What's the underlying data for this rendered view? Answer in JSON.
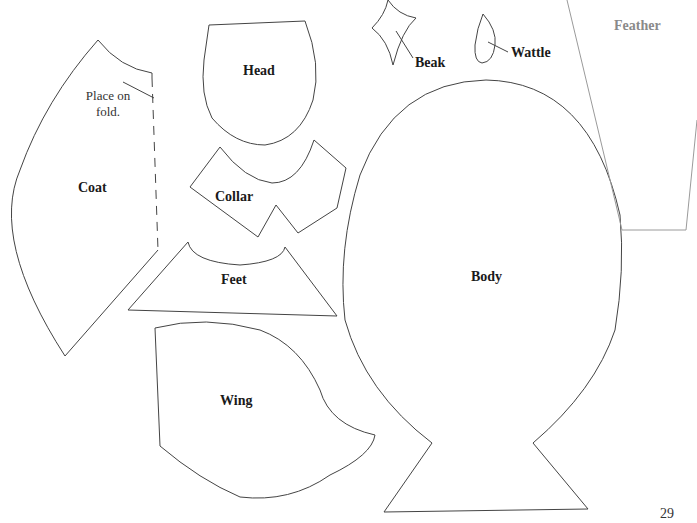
{
  "pieces": {
    "coat": {
      "label": "Coat",
      "note": "Place on fold."
    },
    "head": {
      "label": "Head"
    },
    "collar": {
      "label": "Collar"
    },
    "feet": {
      "label": "Feet"
    },
    "wing": {
      "label": "Wing"
    },
    "beak": {
      "label": "Beak"
    },
    "wattle": {
      "label": "Wattle"
    },
    "body": {
      "label": "Body"
    },
    "feather": {
      "label": "Feather"
    }
  },
  "page_number": "29",
  "colors": {
    "outline": "#444444",
    "feather_outline": "#9a9a9a",
    "feather_label": "#8a8a8a"
  }
}
